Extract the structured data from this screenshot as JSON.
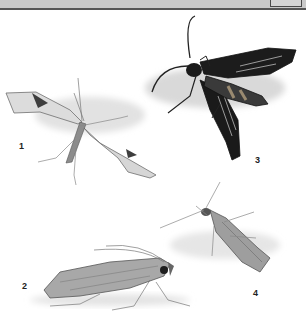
{
  "window": {
    "topbar_color": "#c9c9c9",
    "topbar_border_color": "#555555"
  },
  "plate": {
    "figures": [
      {
        "number": "1",
        "description": "plume moth with slender spread wings, dark triangular marks near wing tips"
      },
      {
        "number": "2",
        "description": "side view of moth with long antennae and mottled grey wings"
      },
      {
        "number": "3",
        "description": "black clearwing moth with banded abdomen"
      },
      {
        "number": "4",
        "description": "slender grey moth with folded wings"
      }
    ]
  }
}
